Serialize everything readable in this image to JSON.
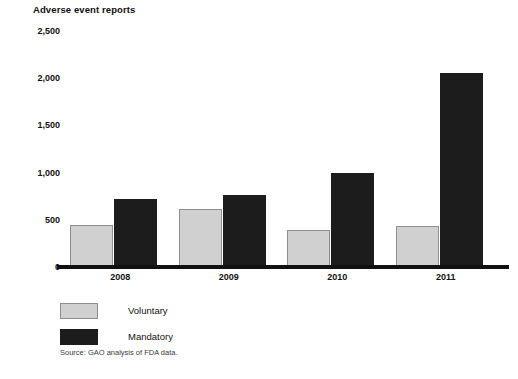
{
  "chart_data": {
    "type": "bar",
    "title": "Adverse event reports",
    "xlabel": "",
    "ylabel": "Adverse event reports",
    "categories": [
      "2008",
      "2009",
      "2010",
      "2011"
    ],
    "series": [
      {
        "name": "Voluntary",
        "color": "#d0d0d0",
        "values": [
          450,
          610,
          390,
          430
        ]
      },
      {
        "name": "Mandatory",
        "color": "#1c1c1c",
        "values": [
          720,
          760,
          1000,
          2050
        ]
      }
    ],
    "ylim": [
      0,
      2500
    ],
    "yticks": [
      0,
      500,
      1000,
      1500,
      2000,
      2500
    ],
    "ytick_labels": [
      "0",
      "500",
      "1,000",
      "1,500",
      "2,000",
      "2,500"
    ],
    "grid": false,
    "legend_position": "bottom-left",
    "source_note": "Source: GAO analysis of FDA data."
  },
  "legend": {
    "items": [
      {
        "label": "Voluntary"
      },
      {
        "label": "Mandatory"
      }
    ]
  }
}
